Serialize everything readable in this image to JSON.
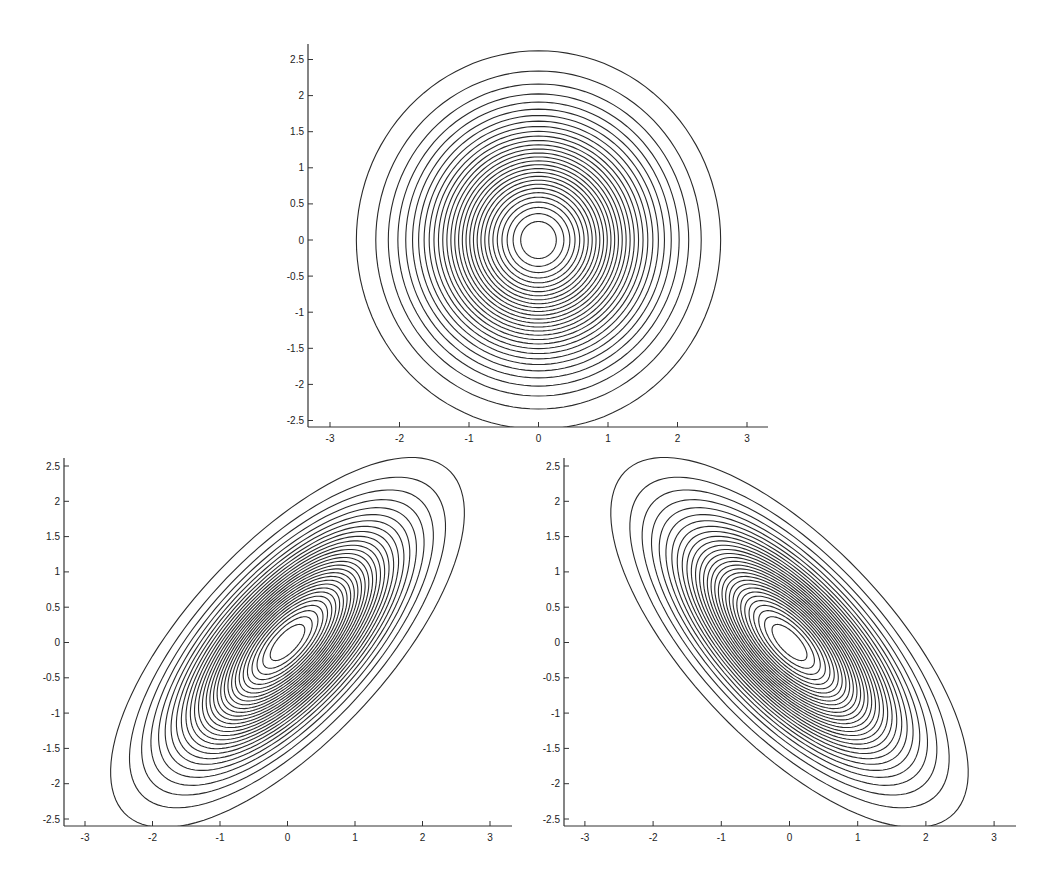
{
  "chart_data": [
    {
      "type": "contour",
      "name": "isotropic-gaussian",
      "title": "",
      "xlabel": "",
      "ylabel": "",
      "xlim": [
        -3.3,
        3.3
      ],
      "ylim": [
        -2.6,
        2.6
      ],
      "xticks": [
        -3,
        -2,
        -1,
        0,
        1,
        2,
        3
      ],
      "yticks": [
        2.5,
        2,
        1.5,
        1,
        0.5,
        0,
        -0.5,
        -1,
        -1.5,
        -2,
        -2.5
      ],
      "xtick_labels": [
        "-3",
        "-2",
        "-1",
        "0",
        "1",
        "2",
        "3"
      ],
      "ytick_labels": [
        "2.5",
        "2",
        "1.5",
        "1",
        "0.5",
        "0",
        "-0.5",
        "-1",
        "-1.5",
        "-2",
        "-2.5"
      ],
      "grid": false,
      "distribution": {
        "mean": [
          0,
          0
        ],
        "sigma_x": 1,
        "sigma_y": 1,
        "rho": 0
      },
      "levels": {
        "count": 30,
        "spacing": "linear in density, k/31 of peak, k=1..30"
      },
      "layout_px": {
        "x0": 538.5,
        "y0": 240,
        "px_per_unit_x": 69.5,
        "px_per_unit_y": 72.2,
        "axis_left": 308,
        "axis_right": 768,
        "axis_top": 44,
        "axis_bottom": 427
      }
    },
    {
      "type": "contour",
      "name": "positively-correlated-gaussian",
      "title": "",
      "xlabel": "",
      "ylabel": "",
      "xlim": [
        -3.3,
        3.3
      ],
      "ylim": [
        -2.6,
        2.6
      ],
      "xticks": [
        -3,
        -2,
        -1,
        0,
        1,
        2,
        3
      ],
      "yticks": [
        2.5,
        2,
        1.5,
        1,
        0.5,
        0,
        -0.5,
        -1,
        -1.5,
        -2,
        -2.5
      ],
      "xtick_labels": [
        "-3",
        "-2",
        "-1",
        "0",
        "1",
        "2",
        "3"
      ],
      "ytick_labels": [
        "2.5",
        "2",
        "1.5",
        "1",
        "0.5",
        "0",
        "-0.5",
        "-1",
        "-1.5",
        "-2",
        "-2.5"
      ],
      "grid": false,
      "distribution": {
        "mean": [
          0,
          0
        ],
        "sigma_x": 1,
        "sigma_y": 1,
        "rho": 0.7
      },
      "levels": {
        "count": 30,
        "spacing": "linear in density, k/31 of peak, k=1..30"
      },
      "layout_px": {
        "x0": 287.5,
        "y0": 642.5,
        "px_per_unit_x": 67.5,
        "px_per_unit_y": 70.6,
        "axis_left": 64,
        "axis_right": 512,
        "axis_top": 458,
        "axis_bottom": 826
      }
    },
    {
      "type": "contour",
      "name": "negatively-correlated-gaussian",
      "title": "",
      "xlabel": "",
      "ylabel": "",
      "xlim": [
        -3.3,
        3.3
      ],
      "ylim": [
        -2.6,
        2.6
      ],
      "xticks": [
        -3,
        -2,
        -1,
        0,
        1,
        2,
        3
      ],
      "yticks": [
        2.5,
        2,
        1.5,
        1,
        0.5,
        0,
        -0.5,
        -1,
        -1.5,
        -2,
        -2.5
      ],
      "xtick_labels": [
        "-3",
        "-2",
        "-1",
        "0",
        "1",
        "2",
        "3"
      ],
      "ytick_labels": [
        "2.5",
        "2",
        "1.5",
        "1",
        "0.5",
        "0",
        "-0.5",
        "-1",
        "-1.5",
        "-2",
        "-2.5"
      ],
      "grid": false,
      "distribution": {
        "mean": [
          0,
          0
        ],
        "sigma_x": 1,
        "sigma_y": 1,
        "rho": -0.7
      },
      "levels": {
        "count": 30,
        "spacing": "linear in density, k/31 of peak, k=1..30"
      },
      "layout_px": {
        "x0": 789.5,
        "y0": 642.5,
        "px_per_unit_x": 68.2,
        "px_per_unit_y": 70.6,
        "axis_left": 564,
        "axis_right": 1016,
        "axis_top": 458,
        "axis_bottom": 826
      }
    }
  ],
  "colors": {
    "line": "#2a2a2a",
    "axis": "#333333",
    "background": "#ffffff"
  }
}
